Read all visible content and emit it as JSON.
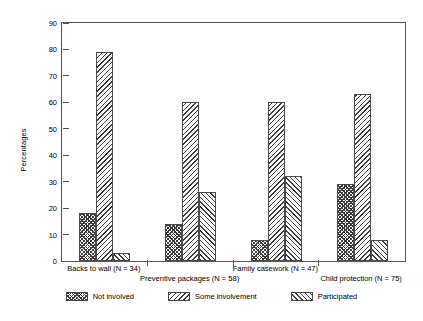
{
  "chart_data": {
    "type": "bar",
    "title": "",
    "xlabel": "",
    "ylabel": "Percentages",
    "ylim": [
      0,
      90
    ],
    "ytick_step": 10,
    "yticks": [
      0,
      10,
      20,
      30,
      40,
      50,
      60,
      70,
      80,
      90
    ],
    "grid": false,
    "legend_position": "bottom",
    "categories": [
      "Backs to wall (N = 34)",
      "Preventive packages (N = 58)",
      "Family casework (N = 47)",
      "Child protection (N = 75)"
    ],
    "series": [
      {
        "name": "Not involved",
        "pattern": "checkerboard",
        "values": [
          18,
          14,
          8,
          29
        ]
      },
      {
        "name": "Some involvement",
        "pattern": "backward-diagonal",
        "values": [
          79,
          60,
          60,
          63
        ]
      },
      {
        "name": "Participated",
        "pattern": "forward-diagonal",
        "values": [
          3,
          26,
          32,
          8
        ]
      }
    ]
  },
  "axis": {
    "y_title": "Percentages",
    "y_tick_labels": [
      "0",
      "10",
      "20",
      "30",
      "40",
      "50",
      "60",
      "70",
      "80",
      "90"
    ]
  },
  "legend": {
    "items": [
      {
        "label": "Not involved"
      },
      {
        "label": "Some involvement"
      },
      {
        "label": "Participated"
      }
    ]
  }
}
